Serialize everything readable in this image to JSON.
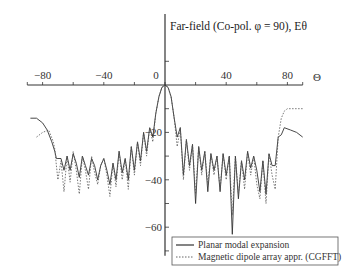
{
  "chart_data": {
    "type": "line",
    "title": "Far-field (Co-pol. φ = 90), Eθ",
    "xlabel": "Θ",
    "ylabel": "",
    "xlim": [
      -90,
      90
    ],
    "ylim": [
      -70,
      0
    ],
    "x_ticks": [
      -80,
      -40,
      0,
      40,
      80
    ],
    "x_tick_labels": [
      "−80",
      "−40",
      "0",
      "40",
      "80"
    ],
    "y_ticks": [
      -20,
      -40,
      -60
    ],
    "y_tick_labels": [
      "−20",
      "−40",
      "−60"
    ],
    "x_minor_ticks": [
      -90,
      -60,
      -20,
      20,
      60,
      90
    ],
    "y_minor_ticks": [
      10,
      -10,
      -30,
      -50,
      -70
    ],
    "grid": false,
    "legend_position": "bottom-right",
    "series": [
      {
        "name": "Planar modal expansion",
        "style": "solid",
        "x": [
          -88,
          -84,
          -80,
          -77,
          -74,
          -72,
          -71,
          -70,
          -68,
          -66,
          -64,
          -62,
          -60,
          -58,
          -56,
          -54,
          -52,
          -50,
          -48,
          -46,
          -44,
          -42,
          -40,
          -38,
          -36,
          -34,
          -32,
          -30,
          -28,
          -26,
          -24,
          -22,
          -20,
          -18,
          -16,
          -14,
          -12,
          -10,
          -8,
          -6,
          -4,
          -2,
          0,
          2,
          4,
          6,
          8,
          10,
          12,
          14,
          16,
          18,
          20,
          22,
          24,
          26,
          28,
          30,
          32,
          34,
          36,
          38,
          40,
          42,
          44,
          46,
          48,
          50,
          52,
          54,
          56,
          58,
          60,
          62,
          64,
          66,
          68,
          70,
          72,
          74,
          76,
          78,
          82,
          86,
          90
        ],
        "values": [
          -14,
          -14,
          -16,
          -19,
          -24,
          -28,
          -31,
          -31,
          -31,
          -36,
          -30,
          -36,
          -29,
          -33,
          -39,
          -30,
          -34,
          -38,
          -31,
          -34,
          -40,
          -34,
          -31,
          -36,
          -42,
          -33,
          -40,
          -28,
          -37,
          -31,
          -40,
          -26,
          -36,
          -24,
          -32,
          -20,
          -28,
          -18,
          -22,
          -12,
          -5,
          -1,
          0,
          -1,
          -5,
          -14,
          -22,
          -18,
          -38,
          -23,
          -34,
          -25,
          -50,
          -26,
          -36,
          -28,
          -45,
          -29,
          -36,
          -30,
          -45,
          -29,
          -38,
          -30,
          -63,
          -30,
          -48,
          -32,
          -40,
          -28,
          -35,
          -30,
          -36,
          -45,
          -32,
          -46,
          -29,
          -34,
          -34,
          -22,
          -21,
          -18,
          -19,
          -20,
          -22
        ]
      },
      {
        "name": "Magnetic dipole array appr. (CGFFT)",
        "style": "dashed",
        "x": [
          -84,
          -80,
          -76,
          -73,
          -72,
          -71,
          -70,
          -68,
          -66,
          -64,
          -62,
          -60,
          -58,
          -56,
          -54,
          -52,
          -50,
          -48,
          -46,
          -44,
          -42,
          -40,
          -38,
          -36,
          -34,
          -32,
          -30,
          -28,
          -26,
          -24,
          -22,
          -20,
          -18,
          -16,
          -14,
          -12,
          -10,
          -8,
          -6,
          -4,
          -2,
          0,
          2,
          4,
          6,
          8,
          10,
          12,
          14,
          16,
          18,
          20,
          22,
          24,
          26,
          28,
          30,
          32,
          34,
          36,
          38,
          40,
          42,
          44,
          46,
          48,
          50,
          52,
          54,
          56,
          58,
          60,
          62,
          64,
          66,
          68,
          70,
          72,
          74,
          76,
          78,
          80,
          84,
          88,
          90
        ],
        "values": [
          -22,
          -20,
          -19,
          -24,
          -27,
          -34,
          -40,
          -32,
          -45,
          -30,
          -41,
          -28,
          -36,
          -46,
          -30,
          -36,
          -44,
          -30,
          -37,
          -42,
          -34,
          -31,
          -38,
          -47,
          -33,
          -43,
          -28,
          -40,
          -31,
          -44,
          -26,
          -38,
          -24,
          -34,
          -20,
          -30,
          -18,
          -24,
          -12,
          -5,
          -1,
          0,
          -1,
          -5,
          -14,
          -26,
          -18,
          -40,
          -23,
          -36,
          -25,
          -46,
          -26,
          -38,
          -28,
          -42,
          -29,
          -38,
          -30,
          -44,
          -29,
          -40,
          -30,
          -55,
          -30,
          -46,
          -32,
          -44,
          -28,
          -38,
          -30,
          -42,
          -48,
          -32,
          -50,
          -29,
          -38,
          -44,
          -22,
          -14,
          -11,
          -10,
          -10,
          -10,
          -10
        ]
      }
    ]
  }
}
